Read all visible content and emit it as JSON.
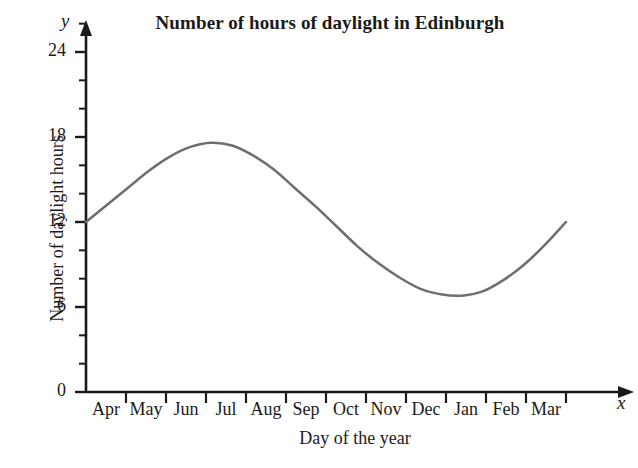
{
  "chart_data": {
    "type": "line",
    "title": "Number of hours of daylight in Edinburgh",
    "xlabel": "Day of the year",
    "ylabel": "Number of daylight hours",
    "x_axis_symbol": "x",
    "y_axis_symbol": "y",
    "categories": [
      "Apr",
      "May",
      "Jun",
      "Jul",
      "Aug",
      "Sep",
      "Oct",
      "Nov",
      "Dec",
      "Jan",
      "Feb",
      "Mar"
    ],
    "y_ticks": [
      0,
      6,
      12,
      18,
      24
    ],
    "y_minor_tick_step": 2,
    "ylim": [
      0,
      26
    ],
    "grid": false,
    "legend": false,
    "series": [
      {
        "name": "Daylight hours",
        "color": "#6e6e6e",
        "x": [
          "Apr",
          "Apr",
          "May",
          "May",
          "Jun",
          "Jun",
          "Jul",
          "Jul",
          "Aug",
          "Aug",
          "Sep",
          "Sep",
          "Oct",
          "Oct",
          "Nov",
          "Nov",
          "Dec",
          "Dec",
          "Jan",
          "Jan",
          "Feb",
          "Feb",
          "Mar",
          "Mar"
        ],
        "values": [
          12.0,
          13.2,
          14.4,
          15.6,
          16.6,
          17.3,
          17.6,
          17.4,
          16.7,
          15.7,
          14.4,
          13.1,
          11.7,
          10.3,
          9.1,
          8.1,
          7.3,
          6.9,
          6.8,
          7.1,
          7.9,
          9.0,
          10.4,
          12.0
        ],
        "peak_value": 17.6,
        "peak_label": "Jun",
        "trough_value": 6.8,
        "trough_label": "Dec",
        "start_value": 12.0,
        "end_value": 12.0
      }
    ]
  },
  "colors": {
    "background": "#ffffff",
    "axis": "#1a1a1a",
    "curve": "#6e6e6e",
    "text": "#1a1a1a"
  }
}
